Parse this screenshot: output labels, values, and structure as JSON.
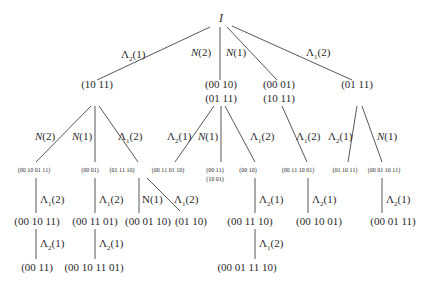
{
  "root": {
    "label": "I"
  },
  "level1": {
    "edges": [
      {
        "label": "Λ2(1)",
        "sym": "Λ",
        "sub": "2",
        "arg": "(1)"
      },
      {
        "label": "N(2)",
        "sym": "N",
        "sub": "",
        "arg": "(2)"
      },
      {
        "label": "N(1)",
        "sym": "N",
        "sub": "",
        "arg": "(1)"
      },
      {
        "label": "Λ1(2)",
        "sym": "Λ",
        "sub": "1",
        "arg": "(2)"
      }
    ],
    "nodes": [
      {
        "lines": [
          "(10 11)"
        ]
      },
      {
        "lines": [
          "(00 10)",
          "(01 11)"
        ]
      },
      {
        "lines": [
          "(00 01)",
          "(10 11)"
        ]
      },
      {
        "lines": [
          "(01 11)"
        ]
      }
    ]
  },
  "level2": {
    "edges": [
      {
        "label": "N(2)",
        "sym": "N",
        "sub": "",
        "arg": "(2)"
      },
      {
        "label": "N(1)",
        "sym": "N",
        "sub": "",
        "arg": "(1)"
      },
      {
        "label": "Λ1(2)",
        "sym": "Λ",
        "sub": "1",
        "arg": "(2)"
      },
      {
        "label": "Λ2(1)",
        "sym": "Λ",
        "sub": "2",
        "arg": "(1)"
      },
      {
        "label": "N(1)",
        "sym": "N",
        "sub": "",
        "arg": "(1)"
      },
      {
        "label": "Λ1(2)",
        "sym": "Λ",
        "sub": "1",
        "arg": "(2)"
      },
      {
        "label": "Λ1(2)",
        "sym": "Λ",
        "sub": "1",
        "arg": "(2)"
      },
      {
        "label": "Λ2(1)",
        "sym": "Λ",
        "sub": "2",
        "arg": "(1)"
      },
      {
        "label": "N(1)",
        "sym": "N",
        "sub": "",
        "arg": "(1)"
      }
    ],
    "nodes": [
      {
        "lines": [
          "(00 10 01 11)"
        ]
      },
      {
        "lines": [
          "(00 01)"
        ]
      },
      {
        "lines": [
          "(01 11 10)"
        ]
      },
      {
        "lines": [
          "(00 11 01 10)"
        ]
      },
      {
        "lines": [
          "(00 11)",
          "(10 01)"
        ]
      },
      {
        "lines": [
          "(00 10)"
        ]
      },
      {
        "lines": [
          "(00 11 10 01)"
        ]
      },
      {
        "lines": [
          "(01 10 11)"
        ]
      },
      {
        "lines": [
          "(00 01 10 11)"
        ]
      }
    ]
  },
  "level3": {
    "edges": [
      {
        "label": "Λ1(2)",
        "sym": "Λ",
        "sub": "1",
        "arg": "(2)"
      },
      {
        "label": "Λ1(2)",
        "sym": "Λ",
        "sub": "1",
        "arg": "(2)"
      },
      {
        "label": "N(1)",
        "sym": "N",
        "sub": "",
        "arg": "(1)"
      },
      {
        "label": "Λ1(2)",
        "sym": "Λ",
        "sub": "1",
        "arg": "(2)"
      },
      {
        "label": "Λ2(1)",
        "sym": "Λ",
        "sub": "2",
        "arg": "(1)"
      },
      {
        "label": "Λ2(1)",
        "sym": "Λ",
        "sub": "2",
        "arg": "(1)"
      },
      {
        "label": "Λ2(1)",
        "sym": "Λ",
        "sub": "2",
        "arg": "(1)"
      }
    ],
    "nodes": [
      {
        "lines": [
          "(00 10 11)"
        ]
      },
      {
        "lines": [
          "(00 11 01)"
        ]
      },
      {
        "lines": [
          "(00 01 10)"
        ]
      },
      {
        "lines": [
          "(01 10)"
        ]
      },
      {
        "lines": [
          "(00 11 10)"
        ]
      },
      {
        "lines": [
          "(00 10 01)"
        ]
      },
      {
        "lines": [
          "(00 01 11)"
        ]
      }
    ]
  },
  "level4": {
    "edges": [
      {
        "label": "Λ2(1)",
        "sym": "Λ",
        "sub": "2",
        "arg": "(1)"
      },
      {
        "label": "Λ2(1)",
        "sym": "Λ",
        "sub": "2",
        "arg": "(1)"
      },
      {
        "label": "Λ1(2)",
        "sym": "Λ",
        "sub": "1",
        "arg": "(2)"
      }
    ],
    "nodes": [
      {
        "lines": [
          "(00 11)"
        ]
      },
      {
        "lines": [
          "(00 10 11 01)"
        ]
      },
      {
        "lines": [
          "(00 01 11 10)"
        ]
      }
    ]
  }
}
